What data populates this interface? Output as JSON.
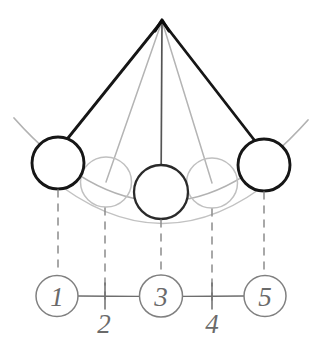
{
  "figure": {
    "background_color": "#ffffff",
    "width": 321,
    "height": 354
  },
  "colors": {
    "ink_dark": "#1a1a1a",
    "ink_mid": "#4a4a4a",
    "ink_light": "#a8a8a8",
    "ink_lighter": "#bdbdbd",
    "dash_gray": "#8a8a8a",
    "timeline_gray": "#6e6e6e"
  },
  "pivot": {
    "label": "pivot-point",
    "x": 162,
    "y": 20
  },
  "rods": [
    {
      "name": "rod-position-1",
      "to_x": 58,
      "to_y": 163,
      "color": "#1a1a1a",
      "width": 2.6
    },
    {
      "name": "rod-position-2",
      "to_x": 106,
      "to_y": 182,
      "color": "#b0b0b0",
      "width": 1.5
    },
    {
      "name": "rod-position-3",
      "to_x": 161,
      "to_y": 192,
      "color": "#4a4a4a",
      "width": 1.6
    },
    {
      "name": "rod-position-4",
      "to_x": 212,
      "to_y": 183,
      "color": "#b0b0b0",
      "width": 1.5
    },
    {
      "name": "rod-position-5",
      "to_x": 264,
      "to_y": 165,
      "color": "#1a1a1a",
      "width": 2.6
    }
  ],
  "bobs": [
    {
      "name": "bob-position-1",
      "cx": 58,
      "cy": 163,
      "r": 26,
      "color": "#1a1a1a",
      "width": 2.6,
      "emphasis": "bold"
    },
    {
      "name": "bob-position-2",
      "cx": 106,
      "cy": 182,
      "r": 25,
      "color": "#bdbdbd",
      "width": 1.4,
      "emphasis": "faint"
    },
    {
      "name": "bob-position-3",
      "cx": 161,
      "cy": 192,
      "r": 27,
      "color": "#2a2a2a",
      "width": 2.2,
      "emphasis": "bold"
    },
    {
      "name": "bob-position-4",
      "cx": 212,
      "cy": 183,
      "r": 25,
      "color": "#bdbdbd",
      "width": 1.4,
      "emphasis": "faint"
    },
    {
      "name": "bob-position-5",
      "cx": 264,
      "cy": 165,
      "r": 26,
      "color": "#1a1a1a",
      "width": 2.6,
      "emphasis": "bold"
    }
  ],
  "swing_arc": {
    "name": "swing-path-arc",
    "color": "#b0b0b0",
    "width": 1.6,
    "path": "M 14 118 Q 162 282 308 120"
  },
  "lower_arc": {
    "name": "swing-path-arc-lower",
    "color": "#c0c0c0",
    "width": 1.4,
    "path": "M 50 178 Q 162 268 272 180"
  },
  "drop_lines": [
    {
      "name": "drop-line-1",
      "x": 58,
      "y1": 189,
      "y2": 275
    },
    {
      "name": "drop-line-2",
      "x": 105,
      "y1": 207,
      "y2": 305
    },
    {
      "name": "drop-line-3",
      "x": 161,
      "y1": 219,
      "y2": 275
    },
    {
      "name": "drop-line-4",
      "x": 212,
      "y1": 208,
      "y2": 305
    },
    {
      "name": "drop-line-5",
      "x": 264,
      "y1": 191,
      "y2": 275
    }
  ],
  "timeline": {
    "name": "timeline-axis",
    "y": 296,
    "x_start": 40,
    "x_end": 285,
    "color": "#6e6e6e",
    "nodes": [
      {
        "name": "timeline-node-1",
        "label": "1",
        "cx": 57,
        "cy": 296,
        "r": 21
      },
      {
        "name": "timeline-node-3",
        "label": "3",
        "cx": 161,
        "cy": 296,
        "r": 21
      },
      {
        "name": "timeline-node-5",
        "label": "5",
        "cx": 265,
        "cy": 296,
        "r": 21
      }
    ],
    "ticks": [
      {
        "name": "timeline-tick-2",
        "label": "2",
        "x": 105,
        "y_top": 284,
        "y_bottom": 308,
        "label_x": 103,
        "label_y": 330
      },
      {
        "name": "timeline-tick-4",
        "label": "4",
        "x": 212,
        "y_top": 284,
        "y_bottom": 308,
        "label_x": 211,
        "label_y": 330
      }
    ]
  }
}
